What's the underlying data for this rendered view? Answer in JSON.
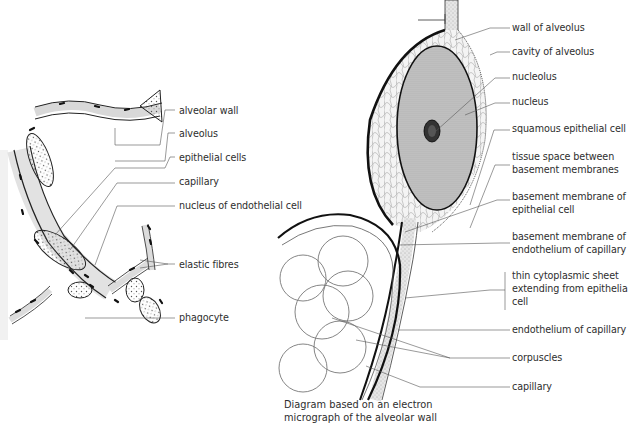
{
  "left_figure": {
    "title": "Alveolar wall section (light microscope view)",
    "labels": [
      {
        "id": "alveolar-wall",
        "text": "alveolar wall",
        "x": 179,
        "y": 104
      },
      {
        "id": "alveolus",
        "text": "alveolus",
        "x": 179,
        "y": 127
      },
      {
        "id": "epithelial-cells",
        "text": "epithelial cells",
        "x": 179,
        "y": 151
      },
      {
        "id": "capillary",
        "text": "capillary",
        "x": 179,
        "y": 175
      },
      {
        "id": "nucleus-of-endothelial-cell",
        "text": "nucleus of endothelial cell",
        "x": 179,
        "y": 199
      },
      {
        "id": "elastic-fibres",
        "text": "elastic fibres",
        "x": 179,
        "y": 258
      },
      {
        "id": "phagocyte",
        "text": "phagocyte",
        "x": 179,
        "y": 311
      }
    ]
  },
  "right_figure": {
    "labels": [
      {
        "id": "wall-of-alveolus",
        "text": "wall of alveolus",
        "x": 512,
        "y": 20
      },
      {
        "id": "cavity-of-alveolus",
        "text": "cavity of alveolus",
        "x": 512,
        "y": 45
      },
      {
        "id": "nucleolus",
        "text": "nucleolus",
        "x": 512,
        "y": 70
      },
      {
        "id": "nucleus",
        "text": "nucleus",
        "x": 512,
        "y": 95
      },
      {
        "id": "squamous-epithelial-cell",
        "text": "squamous epithelial cell",
        "x": 512,
        "y": 122
      },
      {
        "id": "tissue-space",
        "text": "tissue space between\nbasement membranes",
        "x": 512,
        "y": 150
      },
      {
        "id": "basement-membrane-epithelial",
        "text": "basement membrane of\nepithelial cell",
        "x": 512,
        "y": 190
      },
      {
        "id": "basement-membrane-endothelium",
        "text": "basement membrane of\nendothelium of capillary",
        "x": 512,
        "y": 230
      },
      {
        "id": "thin-cytoplasmic-sheet",
        "text": "thin cytoplasmic sheet\nextending from epithelia\ncell",
        "x": 512,
        "y": 269
      },
      {
        "id": "endothelium-of-capillary",
        "text": "endothelium of capillary",
        "x": 512,
        "y": 321
      },
      {
        "id": "corpuscles",
        "text": "corpuscles",
        "x": 512,
        "y": 350
      },
      {
        "id": "capillary-right",
        "text": "capillary",
        "x": 512,
        "y": 378
      }
    ],
    "caption": "Diagram based on an electron\nmicrograph of the alveolar wall"
  }
}
